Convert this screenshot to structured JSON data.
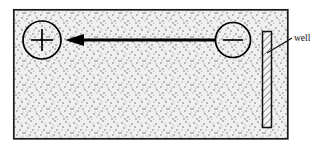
{
  "figure": {
    "type": "electrophoresis-gel-diagram",
    "title": "",
    "gel_box": {
      "name": "gel-slab",
      "x": 13,
      "y": 9,
      "width": 275,
      "height": 130,
      "fill_description": "stippled-gray-texture",
      "fill_color": "#e8e8e8",
      "stroke_color": "#1a1a1a",
      "stroke_width": 1.6
    },
    "electrodes": [
      {
        "name": "anode-positive-electrode",
        "symbol": "+",
        "cx": 42,
        "cy": 40,
        "r": 19,
        "stroke_color": "#000000"
      },
      {
        "name": "cathode-negative-electrode",
        "symbol": "−",
        "cx": 233,
        "cy": 40,
        "r": 17,
        "stroke_color": "#000000"
      }
    ],
    "arrow": {
      "name": "migration-direction-arrow",
      "direction": "left",
      "x_start": 216,
      "x_end": 65,
      "y": 40,
      "color": "#000000",
      "shaft_width": 2.6,
      "head_length": 17,
      "head_half_width": 6
    },
    "well": {
      "name": "sample-well",
      "label": "well",
      "x": 262,
      "y": 31,
      "width": 9,
      "height": 97,
      "hatch_description": "diagonal-hatching",
      "stroke_color": "#111111",
      "fill_color": "#f2f2f2"
    },
    "leader_line": {
      "name": "well-leader-line",
      "x1": 267,
      "y1": 52,
      "x2": 292,
      "y2": 38,
      "color": "#111111"
    },
    "label": {
      "name": "well-label",
      "text": "well",
      "x": 294,
      "y": 42,
      "color": "#111111"
    },
    "colors": {
      "ink": "#000000",
      "gel_fill": "#e8e8e8",
      "page_background": "#ffffff"
    }
  }
}
